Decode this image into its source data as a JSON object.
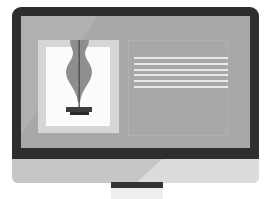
{
  "illustration": {
    "subject": "desktop monitor displaying a web page layout",
    "icon": "monitor-icon",
    "screen": {
      "image_panel": {
        "icon": "vase-lamp-icon"
      },
      "text_panel": {
        "line_count": 6
      }
    }
  },
  "colors": {
    "bezel": "#2e2e2e",
    "screen": "#a8a8a8",
    "frame": "#d6d6d6",
    "image_bg": "#fbfbfb",
    "shape": "#8e8e8e",
    "chin": "#c6c6c6",
    "chin_highlight": "#dcdcdc",
    "text_lines": "#e9e9e9"
  }
}
